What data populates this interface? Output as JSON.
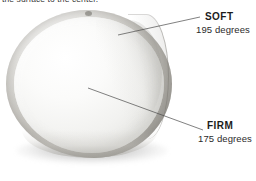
{
  "caption": {
    "clipped_line": "the surface to the center."
  },
  "figure": {
    "background_color": "#ffffff",
    "rind_color": "#a8a6a0",
    "paste_color": "#f4f4f2",
    "leader_line_color": "#4a4a4a",
    "label_color": "#1c1c1c"
  },
  "callouts": [
    {
      "id": "soft",
      "title": "SOFT",
      "value": "195 degrees",
      "leader": {
        "x1": 200,
        "y1": 17,
        "x2": 118,
        "y2": 35
      }
    },
    {
      "id": "firm",
      "title": "FIRM",
      "value": "175 degrees",
      "leader": {
        "x1": 203,
        "y1": 130,
        "x2": 88,
        "y2": 88
      }
    }
  ]
}
